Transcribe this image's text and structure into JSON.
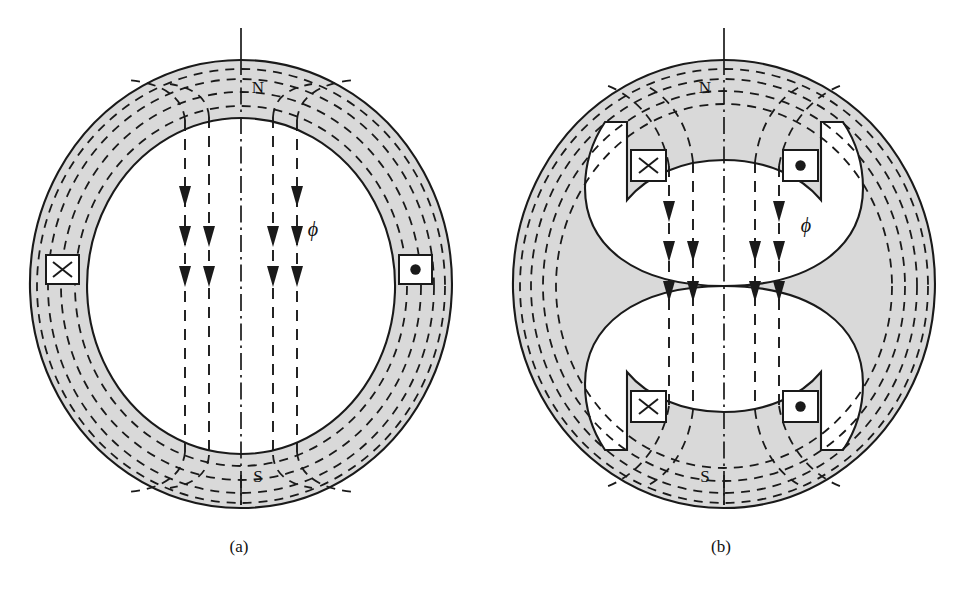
{
  "figure": {
    "background_color": "#ffffff",
    "iron_fill_color": "#d9d9d9",
    "line_color": "#1a1a1a"
  },
  "panels": [
    {
      "id": "a",
      "caption": "(a)",
      "type": "non-salient-pole",
      "pole_labels": {
        "north": "N",
        "south": "S"
      },
      "flux_label": "ϕ",
      "coils": [
        {
          "side": "left",
          "symbol": "x",
          "meaning": "current-into-page"
        },
        {
          "side": "right",
          "symbol": "dot",
          "meaning": "current-out-of-page"
        }
      ],
      "flux_direction": "downward",
      "flux_line_count": 4,
      "arrow_count": 10
    },
    {
      "id": "b",
      "caption": "(b)",
      "type": "salient-pole",
      "pole_labels": {
        "north": "N",
        "south": "S"
      },
      "flux_label": "ϕ",
      "coils": [
        {
          "side": "upper-left",
          "symbol": "x",
          "meaning": "current-into-page"
        },
        {
          "side": "upper-right",
          "symbol": "dot",
          "meaning": "current-out-of-page"
        },
        {
          "side": "lower-left",
          "symbol": "x",
          "meaning": "current-into-page"
        },
        {
          "side": "lower-right",
          "symbol": "dot",
          "meaning": "current-out-of-page"
        }
      ],
      "flux_direction": "downward",
      "flux_line_count": 4,
      "arrow_count": 10
    }
  ]
}
